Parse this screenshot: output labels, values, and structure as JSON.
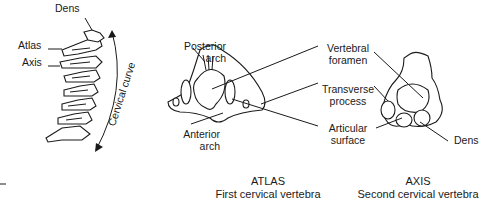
{
  "figure": {
    "spine_view": {
      "labels": {
        "dens": "Dens",
        "atlas": "Atlas",
        "axis": "Axis",
        "curve": "Cervical curve"
      }
    },
    "atlas_view": {
      "labels": {
        "posterior_arch_1": "Posterior",
        "posterior_arch_2": "arch",
        "anterior_arch_1": "Anterior",
        "anterior_arch_2": "arch"
      },
      "caption_title": "ATLAS",
      "caption_subtitle": "First cervical vertebra"
    },
    "shared_labels": {
      "vertebral_foramen_1": "Vertebral",
      "vertebral_foramen_2": "foramen",
      "transverse_process_1": "Transverse",
      "transverse_process_2": "process",
      "articular_surface_1": "Articular",
      "articular_surface_2": "surface"
    },
    "axis_view": {
      "labels": {
        "dens": "Dens"
      },
      "caption_title": "AXIS",
      "caption_subtitle": "Second cervical vertebra"
    }
  }
}
